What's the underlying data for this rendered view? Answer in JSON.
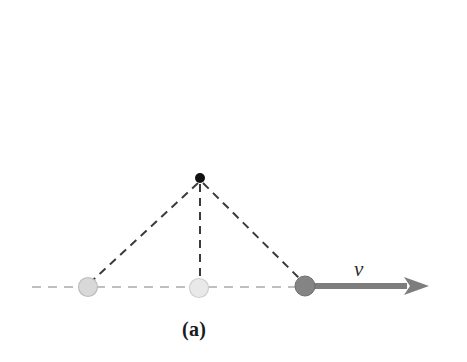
{
  "figure": {
    "caption": "(a)",
    "velocity_label": "v",
    "background_color": "#ffffff",
    "width": 467,
    "height": 362
  },
  "colors": {
    "apex_dot": "#111111",
    "ball_left": "#d8d8d8",
    "ball_left_edge": "#bdbdbd",
    "ball_middle": "#e9e9e9",
    "ball_middle_edge": "#cfcfcf",
    "ball_right": "#848484",
    "ball_right_edge": "#6f6f6f",
    "baseline_dash": "#bfbfbf",
    "string_dash": "#3a3a3a",
    "arrow": "#7d7d7d",
    "caption_text": "#1a1a1a"
  },
  "geometry": {
    "baseline": {
      "y": 287,
      "x_start": 32,
      "x_end": 306,
      "dash": "9 7",
      "width": 2
    },
    "apex": {
      "x": 200,
      "y": 178,
      "radius": 5
    },
    "balls": [
      {
        "name": "ball-left",
        "x": 88,
        "y": 287,
        "radius": 9.5,
        "shade": "light"
      },
      {
        "name": "ball-middle",
        "x": 199,
        "y": 288,
        "radius": 9.5,
        "shade": "lightest"
      },
      {
        "name": "ball-right",
        "x": 305,
        "y": 286,
        "radius": 10,
        "shade": "dark"
      }
    ],
    "strings": [
      {
        "name": "string-left",
        "x1": 198,
        "y1": 183,
        "x2": 92,
        "y2": 281
      },
      {
        "name": "string-vertical",
        "x1": 200,
        "y1": 184,
        "x2": 200,
        "y2": 279
      },
      {
        "name": "string-right",
        "x1": 203,
        "y1": 183,
        "x2": 300,
        "y2": 279
      }
    ],
    "string_dash": "8 6",
    "string_width": 2,
    "arrow": {
      "y": 286,
      "x_start": 305,
      "x_shaft_end": 406,
      "x_tip": 429,
      "shaft_width": 6,
      "head_half_height": 9
    },
    "velocity_label_pos": {
      "x": 362,
      "y": 270
    },
    "caption_pos": {
      "x": 199,
      "y": 330
    }
  },
  "chart_data": {
    "type": "diagram",
    "title": "(a)",
    "annotations": [
      {
        "label": "v",
        "meaning": "velocity vector",
        "direction": "right",
        "at": "rightmost bob"
      }
    ],
    "elements": [
      {
        "name": "pivot",
        "kind": "point",
        "x": 200,
        "y": 178
      },
      {
        "name": "bob-position-1",
        "kind": "circle",
        "x": 88,
        "y": 287,
        "tone": "faded"
      },
      {
        "name": "bob-position-2",
        "kind": "circle",
        "x": 199,
        "y": 288,
        "tone": "faded"
      },
      {
        "name": "bob-position-3",
        "kind": "circle",
        "x": 305,
        "y": 286,
        "tone": "solid"
      },
      {
        "name": "reference-line",
        "kind": "dashed-horizontal",
        "y": 287
      },
      {
        "name": "velocity-arrow",
        "kind": "arrow",
        "from_x": 305,
        "to_x": 429,
        "y": 286
      }
    ]
  }
}
